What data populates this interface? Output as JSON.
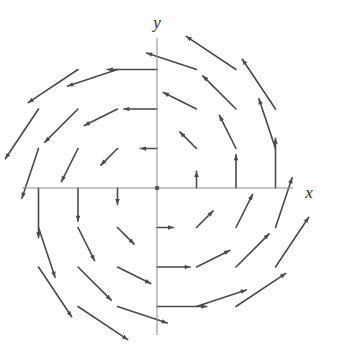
{
  "figure": {
    "title": "",
    "background_color": "#ffffff"
  },
  "axes": {
    "x_label": "x",
    "y_label": "y",
    "axis_color": "#8d8d8d",
    "origin_dot_color": "#555555",
    "x_axis": {
      "pixel_y": 188,
      "pixel_x_start": 22,
      "pixel_x_end": 293
    },
    "y_axis": {
      "pixel_x": 157,
      "pixel_y_start": 38,
      "pixel_y_end": 335
    },
    "origin": {
      "x": 0,
      "y": 0,
      "pixel_x": 157,
      "pixel_y": 188
    },
    "tick_spacing_px": 39.5,
    "x_label_position": {
      "pixel_x": 309,
      "pixel_y": 194
    },
    "y_label_position": {
      "pixel_x": 157,
      "pixel_y": 24
    }
  },
  "chart_data": {
    "type": "scatter",
    "plot_kind": "vector-field",
    "title": "",
    "subtitle": "",
    "xlabel": "x",
    "ylabel": "y",
    "xlim": [
      -3.5,
      3.5
    ],
    "ylim": [
      -3.5,
      3.5
    ],
    "grid": false,
    "legend": null,
    "field_expression": "F(x, y) = (-y, x)",
    "field_description": "Counterclockwise rotational vector field; arrow length grows with distance from the origin; vectors are tangent to circles centered at the origin.",
    "arrow_color": "#4a4a4a",
    "arrow_line_width": 1.6,
    "arrow_head_length": 5.5,
    "grid_x_values": [
      -3,
      -2,
      -1,
      0,
      1,
      2,
      3
    ],
    "grid_y_values": [
      -3,
      -2,
      -1,
      0,
      1,
      2,
      3
    ],
    "length_scale": 0.42,
    "clip_radius": 4.0,
    "vectors": [
      {
        "x": -3,
        "y": 3,
        "u": -3,
        "v": -3
      },
      {
        "x": -2,
        "y": 3,
        "u": -3,
        "v": -2
      },
      {
        "x": -1,
        "y": 3,
        "u": -3,
        "v": -1
      },
      {
        "x": 0,
        "y": 3,
        "u": -3,
        "v": 0
      },
      {
        "x": 1,
        "y": 3,
        "u": -3,
        "v": 1
      },
      {
        "x": 2,
        "y": 3,
        "u": -3,
        "v": 2
      },
      {
        "x": 3,
        "y": 3,
        "u": -3,
        "v": 3
      },
      {
        "x": -3,
        "y": 2,
        "u": -2,
        "v": -3
      },
      {
        "x": -2,
        "y": 2,
        "u": -2,
        "v": -2
      },
      {
        "x": -1,
        "y": 2,
        "u": -2,
        "v": -1
      },
      {
        "x": 0,
        "y": 2,
        "u": -2,
        "v": 0
      },
      {
        "x": 1,
        "y": 2,
        "u": -2,
        "v": 1
      },
      {
        "x": 2,
        "y": 2,
        "u": -2,
        "v": 2
      },
      {
        "x": 3,
        "y": 2,
        "u": -2,
        "v": 3
      },
      {
        "x": -3,
        "y": 1,
        "u": -1,
        "v": -3
      },
      {
        "x": -2,
        "y": 1,
        "u": -1,
        "v": -2
      },
      {
        "x": -1,
        "y": 1,
        "u": -1,
        "v": -1
      },
      {
        "x": 0,
        "y": 1,
        "u": -1,
        "v": 0
      },
      {
        "x": 1,
        "y": 1,
        "u": -1,
        "v": 1
      },
      {
        "x": 2,
        "y": 1,
        "u": -1,
        "v": 2
      },
      {
        "x": 3,
        "y": 1,
        "u": -1,
        "v": 3
      },
      {
        "x": -3,
        "y": 0,
        "u": 0,
        "v": -3
      },
      {
        "x": -2,
        "y": 0,
        "u": 0,
        "v": -2
      },
      {
        "x": -1,
        "y": 0,
        "u": 0,
        "v": -1
      },
      {
        "x": 1,
        "y": 0,
        "u": 0,
        "v": 1
      },
      {
        "x": 2,
        "y": 0,
        "u": 0,
        "v": 2
      },
      {
        "x": 3,
        "y": 0,
        "u": 0,
        "v": 3
      },
      {
        "x": -3,
        "y": -1,
        "u": 1,
        "v": -3
      },
      {
        "x": -2,
        "y": -1,
        "u": 1,
        "v": -2
      },
      {
        "x": -1,
        "y": -1,
        "u": 1,
        "v": -1
      },
      {
        "x": 0,
        "y": -1,
        "u": 1,
        "v": 0
      },
      {
        "x": 1,
        "y": -1,
        "u": 1,
        "v": 1
      },
      {
        "x": 2,
        "y": -1,
        "u": 1,
        "v": 2
      },
      {
        "x": 3,
        "y": -1,
        "u": 1,
        "v": 3
      },
      {
        "x": -3,
        "y": -2,
        "u": 2,
        "v": -3
      },
      {
        "x": -2,
        "y": -2,
        "u": 2,
        "v": -2
      },
      {
        "x": -1,
        "y": -2,
        "u": 2,
        "v": -1
      },
      {
        "x": 0,
        "y": -2,
        "u": 2,
        "v": 0
      },
      {
        "x": 1,
        "y": -2,
        "u": 2,
        "v": 1
      },
      {
        "x": 2,
        "y": -2,
        "u": 2,
        "v": 2
      },
      {
        "x": 3,
        "y": -2,
        "u": 2,
        "v": 3
      },
      {
        "x": -3,
        "y": -3,
        "u": 3,
        "v": -3
      },
      {
        "x": -2,
        "y": -3,
        "u": 3,
        "v": -2
      },
      {
        "x": -1,
        "y": -3,
        "u": 3,
        "v": -1
      },
      {
        "x": 0,
        "y": -3,
        "u": 3,
        "v": 0
      },
      {
        "x": 1,
        "y": -3,
        "u": 3,
        "v": 1
      },
      {
        "x": 2,
        "y": -3,
        "u": 3,
        "v": 2
      },
      {
        "x": 3,
        "y": -3,
        "u": 3,
        "v": 3
      }
    ]
  }
}
